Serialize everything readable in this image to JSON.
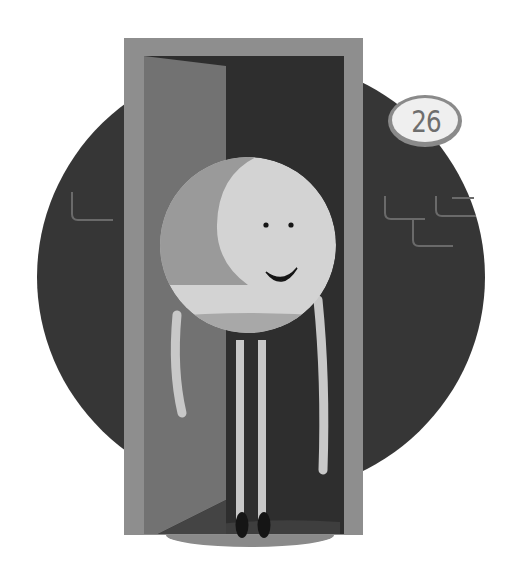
{
  "illustration": {
    "description": "Round smiling character standing in an open doorway in front of a dark circle",
    "badge": {
      "number": "26"
    },
    "colors": {
      "background": "#ffffff",
      "circle": "#363636",
      "brick_lines": "#6a6a6a",
      "door_frame": "#8e8e8e",
      "doorway_dark": "#2e2e2e",
      "door_panel": "#727272",
      "floor_light": "#8a8a8a",
      "character_face": "#d3d3d3",
      "character_cap": "#9a9a9a",
      "character_belly": "#a8a8a8",
      "limbs": "#c8c8c8",
      "shoes": "#151515",
      "badge_fill": "#efefef",
      "badge_outline": "#8a8a8a",
      "badge_text": "#6e6e6e"
    }
  }
}
